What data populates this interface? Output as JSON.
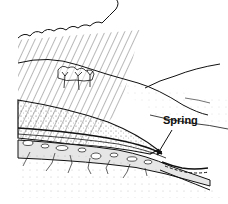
{
  "diagram": {
    "labels": {
      "spring": "Spring"
    },
    "elements": [
      "rain cloud",
      "rain",
      "trees",
      "hills",
      "permeable soil layer",
      "rock layer",
      "impermeable bedrock",
      "stream"
    ]
  }
}
